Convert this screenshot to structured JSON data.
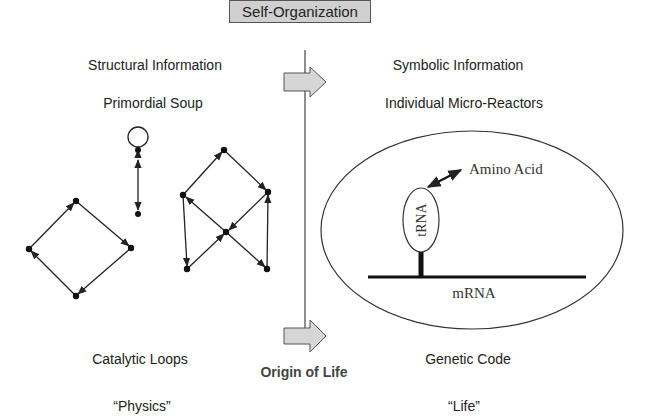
{
  "title": "Self-Organization",
  "left": {
    "heading": "Structural Information",
    "subheading": "Primordial Soup",
    "caption": "Catalytic Loops",
    "category": "“Physics”"
  },
  "center": {
    "caption": "Origin of Life"
  },
  "right": {
    "heading": "Symbolic Information",
    "subheading": "Individual Micro-Reactors",
    "caption": "Genetic Code",
    "category": "“Life”",
    "labels": {
      "amino_acid": "Amino Acid",
      "trna": "tRNA",
      "mrna": "mRNA"
    }
  },
  "colors": {
    "box_fill": "#d0d0d0",
    "arrow_fill": "#d6d6d6",
    "line": "#222222"
  }
}
